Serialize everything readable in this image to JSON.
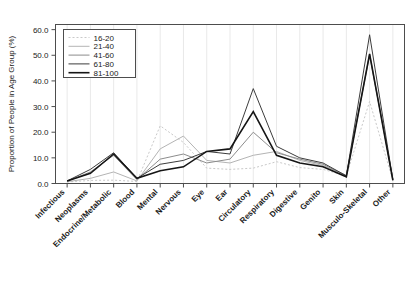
{
  "chart_data": {
    "type": "line",
    "title": "",
    "xlabel": "",
    "ylabel": "Proportion of People in Age Group (%)",
    "ylim": [
      0,
      62
    ],
    "yticks": [
      "0.0",
      "10.0",
      "20.0",
      "30.0",
      "40.0",
      "50.0",
      "60.0"
    ],
    "ytick_values": [
      0,
      10,
      20,
      30,
      40,
      50,
      60
    ],
    "grid": "vertical",
    "legend_position": "top-left",
    "legend_title": "",
    "categories": [
      "Infectious",
      "Neoplasms",
      "Endocrine/Metabolic",
      "Blood",
      "Mental",
      "Nervous",
      "Eye",
      "Ear",
      "Circulatory",
      "Respiratory",
      "Digestive",
      "Genito",
      "Skin",
      "Musculo-Skeletal",
      "Other"
    ],
    "series": [
      {
        "name": "16-20",
        "color": "#c9c9c9",
        "width": 1.0,
        "dash": "2,2",
        "values": [
          0.6,
          1.2,
          1.3,
          0.8,
          22.5,
          16.0,
          6.0,
          5.5,
          6.0,
          8.5,
          6.2,
          5.5,
          3.0,
          32.0,
          1.2
        ]
      },
      {
        "name": "21-40",
        "color": "#b4b4b4",
        "width": 1.0,
        "dash": "none",
        "values": [
          0.7,
          2.0,
          4.5,
          1.0,
          13.5,
          18.5,
          9.0,
          8.0,
          11.0,
          12.5,
          9.0,
          7.0,
          3.2,
          50.0,
          1.8
        ]
      },
      {
        "name": "41-60",
        "color": "#8c8c8c",
        "width": 1.0,
        "dash": "none",
        "values": [
          0.9,
          4.5,
          11.0,
          1.5,
          9.5,
          11.5,
          8.0,
          9.5,
          20.0,
          12.0,
          9.5,
          7.5,
          3.0,
          50.5,
          1.6
        ]
      },
      {
        "name": "61-80",
        "color": "#3c3c3c",
        "width": 1.0,
        "dash": "none",
        "values": [
          1.0,
          5.5,
          12.0,
          2.0,
          7.5,
          9.0,
          12.5,
          11.5,
          37.0,
          14.5,
          10.0,
          8.0,
          3.0,
          58.0,
          1.4
        ]
      },
      {
        "name": "81-100",
        "color": "#151515",
        "width": 1.6,
        "dash": "none",
        "values": [
          1.0,
          4.0,
          11.5,
          2.0,
          5.0,
          6.5,
          12.5,
          13.5,
          28.0,
          11.0,
          8.0,
          6.5,
          2.6,
          50.5,
          1.2
        ]
      }
    ]
  }
}
